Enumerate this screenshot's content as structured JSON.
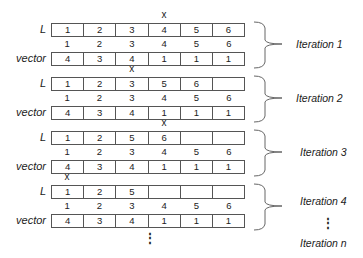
{
  "labels": {
    "list": "L",
    "vector": "vector"
  },
  "marker": "x",
  "indices": [
    "1",
    "2",
    "3",
    "4",
    "5",
    "6"
  ],
  "iterations": [
    {
      "label": "Iteration 1",
      "marker_col": 3,
      "L": [
        "1",
        "2",
        "3",
        "4",
        "5",
        "6"
      ],
      "vector": [
        "4",
        "3",
        "4",
        "1",
        "1",
        "1"
      ]
    },
    {
      "label": "Iteration 2",
      "marker_col": 2,
      "L": [
        "1",
        "2",
        "3",
        "5",
        "6",
        ""
      ],
      "vector": [
        "4",
        "3",
        "4",
        "1",
        "1",
        "1"
      ]
    },
    {
      "label": "Iteration 3",
      "marker_col": 3,
      "L": [
        "1",
        "2",
        "5",
        "6",
        "",
        ""
      ],
      "vector": [
        "4",
        "3",
        "4",
        "1",
        "1",
        "1"
      ]
    },
    {
      "label": "Iteration 4",
      "marker_col": 0,
      "L": [
        "1",
        "2",
        "5",
        "",
        "",
        ""
      ],
      "vector": [
        "4",
        "3",
        "4",
        "1",
        "1",
        "1"
      ]
    }
  ],
  "continuation": {
    "dots": "⋮",
    "final_label": "Iteration n"
  }
}
